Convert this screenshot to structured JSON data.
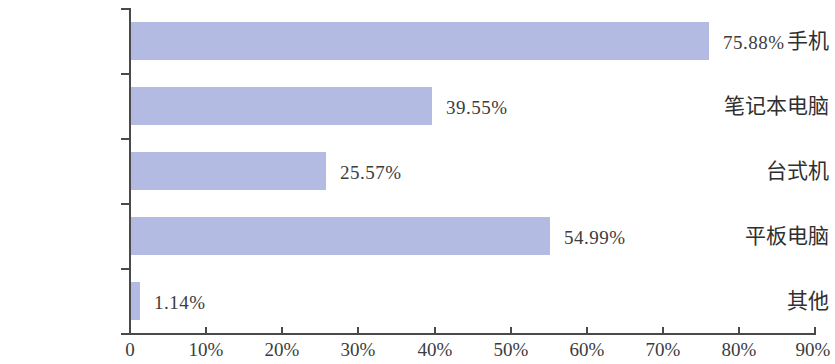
{
  "chart_data": {
    "type": "bar",
    "orientation": "horizontal",
    "title": "",
    "xlabel": "",
    "ylabel": "",
    "categories": [
      "手机",
      "笔记本电脑",
      "台式机",
      "平板电脑",
      "其他"
    ],
    "values": [
      75.88,
      39.55,
      25.57,
      54.99,
      1.14
    ],
    "value_labels": [
      "75.88%",
      "39.55%",
      "25.57%",
      "54.99%",
      "1.14%"
    ],
    "xlim": [
      0,
      90
    ],
    "xticks": [
      0,
      10,
      20,
      30,
      40,
      50,
      60,
      70,
      80,
      90
    ],
    "xtick_labels": [
      "0",
      "10%",
      "20%",
      "30%",
      "40%",
      "50%",
      "60%",
      "70%",
      "80%",
      "90%"
    ],
    "grid": false,
    "legend": null,
    "bar_color": "#b3bbe3",
    "axis_color": "#4a4a4a",
    "text_color": "#3c3c3c",
    "background": "#ffffff"
  }
}
